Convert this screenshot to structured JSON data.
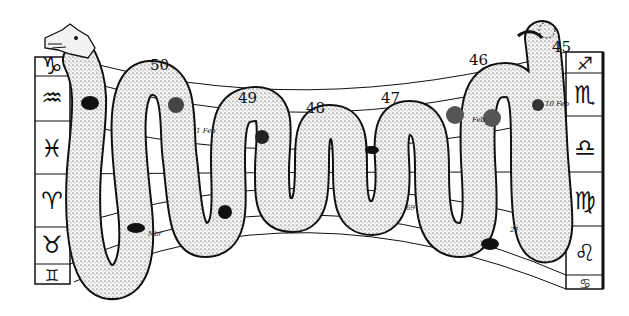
{
  "figure": {
    "left_signs": [
      "♑",
      "♒",
      "♓",
      "♈",
      "♉",
      "♊"
    ],
    "left_sign_names": [
      "Capricorn",
      "Aquarius",
      "Pisces",
      "Aries",
      "Taurus",
      "Gemini"
    ],
    "right_signs": [
      "♐",
      "♏",
      "♎",
      "♍",
      "♌",
      "♋"
    ],
    "right_sign_names": [
      "Sagittarius",
      "Scorpio",
      "Libra",
      "Virgo",
      "Leo",
      "Cancer"
    ],
    "coil_numbers": [
      "50",
      "49",
      "48",
      "47",
      "46",
      "45"
    ],
    "annotations": {
      "feb_left": "1 Feb",
      "feb_right": "10 Feb",
      "feb_mid": "Feb",
      "nbr": "Nbr",
      "cancer_mark": "69",
      "leo_mark": "21"
    }
  }
}
